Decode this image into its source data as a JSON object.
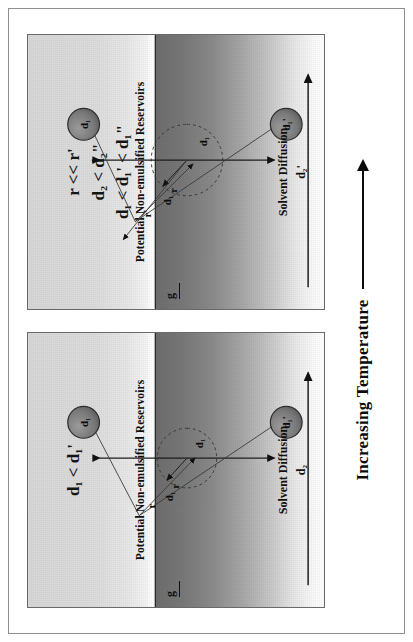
{
  "figure": {
    "axis_label": "Increasing Temperature",
    "axis_arrow": "right-arrow-icon"
  },
  "panels": [
    {
      "id": "panel-low-temperature",
      "inequalities": [
        "d₁ < d₁'"
      ],
      "reservoir_label": "Potential Non-emulsified Reservoirs",
      "solvent_label": "Solvent Diffusion",
      "solvent_value": "d₂",
      "gravity_label": "g",
      "droplet_top_label": "d₁",
      "droplet_bottom_label": "d₁'",
      "core_label": "d₁",
      "radius_label": "r",
      "radius_label_outer": "r",
      "distance_label": "d₁"
    },
    {
      "id": "panel-high-temperature",
      "inequalities": [
        "r << r'",
        "d₂ < d₂\"",
        "d₁ < d₁' < d₁\""
      ],
      "reservoir_label": "Potential Non-emulsified Reservoirs",
      "solvent_label": "Solvent Diffusion",
      "solvent_value": "d₂'",
      "gravity_label": "g",
      "droplet_top_label": "d₁",
      "droplet_bottom_label": "d₁'",
      "core_label": "d₁",
      "radius_label": "r",
      "radius_label_outer": "r'",
      "distance_label": "d₁"
    }
  ],
  "colors": {
    "ink": "#0b0b0b",
    "frame": "#8e8e8e",
    "panel_border": "#6a6a6a",
    "solvent_dark": "#6e6e6e",
    "droplet_fill": "#7a7a7a"
  }
}
